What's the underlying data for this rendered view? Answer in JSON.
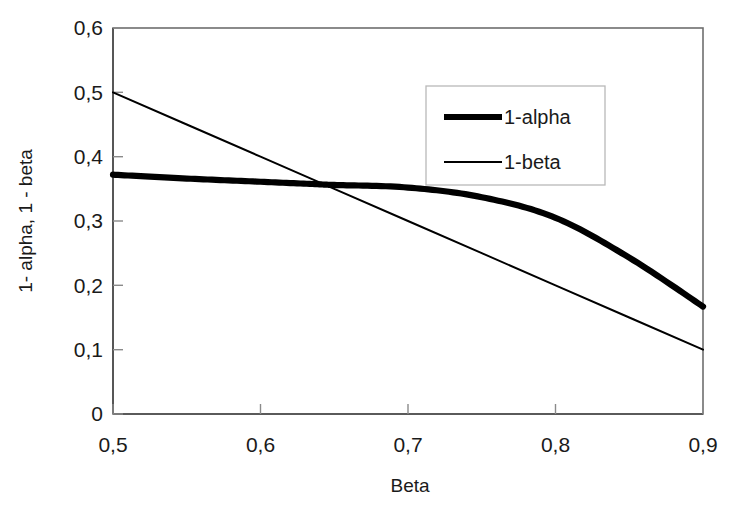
{
  "chart_data": {
    "type": "line",
    "title": "",
    "xlabel": "Beta",
    "ylabel": "1- alpha, 1 - beta",
    "xlim": [
      0.5,
      0.9
    ],
    "ylim": [
      0,
      0.6
    ],
    "grid": false,
    "decimal_separator": ",",
    "legend_position": "upper-right-inside",
    "x_tick_labels": [
      "0,5",
      "0,6",
      "0,7",
      "0,8",
      "0,9"
    ],
    "x_tick_values": [
      0.5,
      0.6,
      0.7,
      0.8,
      0.9
    ],
    "y_tick_labels": [
      "0",
      "0,1",
      "0,2",
      "0,3",
      "0,4",
      "0,5",
      "0,6"
    ],
    "y_tick_values": [
      0,
      0.1,
      0.2,
      0.3,
      0.4,
      0.5,
      0.6
    ],
    "x": [
      0.5,
      0.55,
      0.6,
      0.64,
      0.65,
      0.7,
      0.75,
      0.8,
      0.85,
      0.9
    ],
    "series": [
      {
        "name": "1-alpha",
        "style": "thick",
        "color": "#000000",
        "values": [
          0.372,
          0.366,
          0.361,
          0.357,
          0.356,
          0.352,
          0.337,
          0.305,
          0.243,
          0.167
        ]
      },
      {
        "name": "1-beta",
        "style": "thin",
        "color": "#000000",
        "values": [
          0.5,
          0.45,
          0.4,
          0.36,
          0.35,
          0.3,
          0.25,
          0.2,
          0.15,
          0.1
        ]
      }
    ],
    "crossover": {
      "x": 0.645,
      "y": 0.356
    }
  },
  "legend": {
    "entries": [
      {
        "label": "1-alpha"
      },
      {
        "label": "1-beta"
      }
    ]
  },
  "axes": {
    "x_title": "Beta",
    "y_title": "1- alpha, 1 - beta"
  }
}
